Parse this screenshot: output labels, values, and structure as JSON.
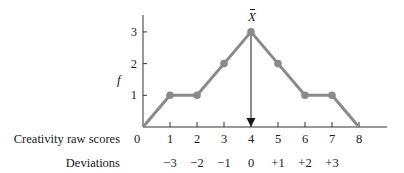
{
  "chart_data": {
    "type": "line",
    "title": "",
    "xlabel": "Creativity raw scores",
    "ylabel": "f",
    "x": [
      0,
      1,
      2,
      3,
      4,
      5,
      6,
      7,
      8
    ],
    "series": [
      {
        "name": "frequency",
        "values": [
          0,
          1,
          1,
          2,
          3,
          2,
          1,
          1,
          0
        ]
      }
    ],
    "x_tick_labels": [
      "0",
      "1",
      "2",
      "3",
      "4",
      "5",
      "6",
      "7",
      "8"
    ],
    "y_tick_labels": [
      "1",
      "2",
      "3"
    ],
    "deviations_label": "Deviations",
    "deviations": [
      "−3",
      "−2",
      "−1",
      "0",
      "+1",
      "+2",
      "+3"
    ],
    "deviation_positions": [
      1,
      2,
      3,
      4,
      5,
      6,
      7
    ],
    "annotation": {
      "label": "X̄",
      "x": 4,
      "description": "mean marked with downward arrow"
    },
    "xlim": [
      0,
      9
    ],
    "ylim": [
      0,
      3.5
    ],
    "grid": false,
    "line_color": "#8a8a8a",
    "point_color": "#8a8a8a"
  },
  "labels": {
    "x_row": "Creativity raw scores",
    "dev_row": "Deviations",
    "y_axis": "f",
    "mean": "X"
  }
}
